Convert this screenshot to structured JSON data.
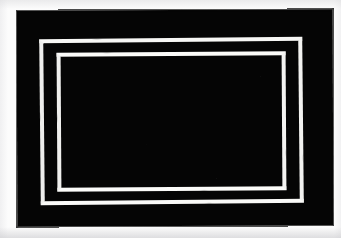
{
  "artwork": {
    "title": "Concentric rectangular frames",
    "medium_description": "Two nested white rectangular outlines painted on a solid black field",
    "orientation": "landscape",
    "canvas": {
      "width": 341,
      "height": 238
    },
    "colors": {
      "paper_background": "#fcfcfc",
      "field_black": "#050505",
      "frame_white": "#f4f4f2"
    },
    "elements": {
      "black_field": {
        "label": "black field",
        "x": 17,
        "y": 10,
        "width": 316,
        "height": 216
      },
      "outer_frame": {
        "label": "outer white frame",
        "x": 40,
        "y": 38,
        "width": 263,
        "height": 166,
        "stroke_width": 4
      },
      "inner_frame": {
        "label": "inner white frame",
        "x": 57,
        "y": 52,
        "width": 229,
        "height": 139,
        "stroke_width": 4
      }
    }
  }
}
